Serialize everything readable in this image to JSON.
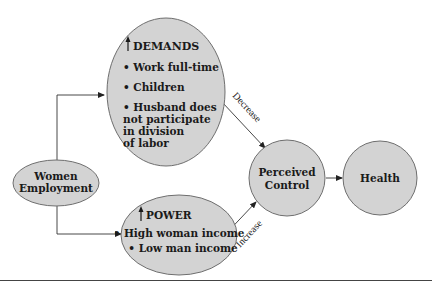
{
  "diagram": {
    "nodes": {
      "women_employment": {
        "lines": [
          "Women",
          "Employment"
        ]
      },
      "demands": {
        "title": "DEMANDS",
        "title_icon": "up-arrow-icon",
        "items": [
          [
            "• Work full-time"
          ],
          [
            "• Children"
          ],
          [
            "• Husband does",
            "not participate",
            "in division",
            "of labor"
          ]
        ]
      },
      "power": {
        "title": "POWER",
        "title_icon": "up-arrow-icon",
        "items": [
          "• High woman income",
          "• Low man income"
        ]
      },
      "perceived_control": {
        "lines": [
          "Perceived",
          "Control"
        ]
      },
      "health": {
        "label": "Health"
      }
    },
    "edges": {
      "demands_to_control": {
        "label": "Decrease"
      },
      "power_to_control": {
        "label": "Increase"
      }
    },
    "colors": {
      "node_fill": "#d3d3d3",
      "node_stroke": "#6e6e6e",
      "text": "#1a1a1a"
    }
  }
}
